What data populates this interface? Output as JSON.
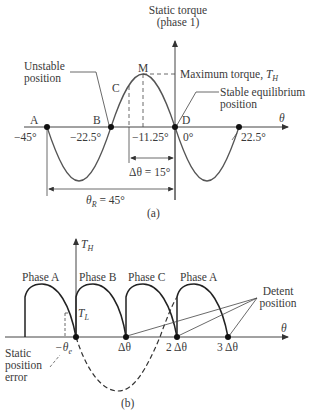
{
  "panel_a": {
    "axis_y_title_line1": "Static torque",
    "axis_y_title_line2": "(phase 1)",
    "axis_x_label": "θ",
    "points": {
      "A": "A",
      "B": "B",
      "C": "C",
      "M": "M",
      "D": "D"
    },
    "ticks": {
      "t1": "−45°",
      "t2": "−22.5°",
      "t3": "−11.25°",
      "t4": "0°",
      "t5": "22.5°"
    },
    "unstable_line1": "Unstable",
    "unstable_line2": "position",
    "max_torque": "Maximum torque, ",
    "max_torque_sym": "T",
    "max_torque_sub": "H",
    "stable_line1": "Stable equilibrium",
    "stable_line2": "position",
    "delta_theta": "Δθ = 15°",
    "theta_r_sym": "θ",
    "theta_r_sub": "R",
    "theta_r_val": " = 45°",
    "caption": "(a)"
  },
  "panel_b": {
    "axis_y_sym": "T",
    "axis_y_sub": "H",
    "axis_x_label": "θ",
    "phases": [
      "Phase A",
      "Phase B",
      "Phase C",
      "Phase A"
    ],
    "tl_sym": "T",
    "tl_sub": "L",
    "neg_theta_e": "−θ",
    "neg_theta_e_sub": "e",
    "ticks": [
      "Δθ",
      "2 Δθ",
      "3 Δθ"
    ],
    "detent_line1": "Detent",
    "detent_line2": "position",
    "static_err_line1": "Static",
    "static_err_line2": "position",
    "static_err_line3": "error",
    "caption": "(b)"
  }
}
